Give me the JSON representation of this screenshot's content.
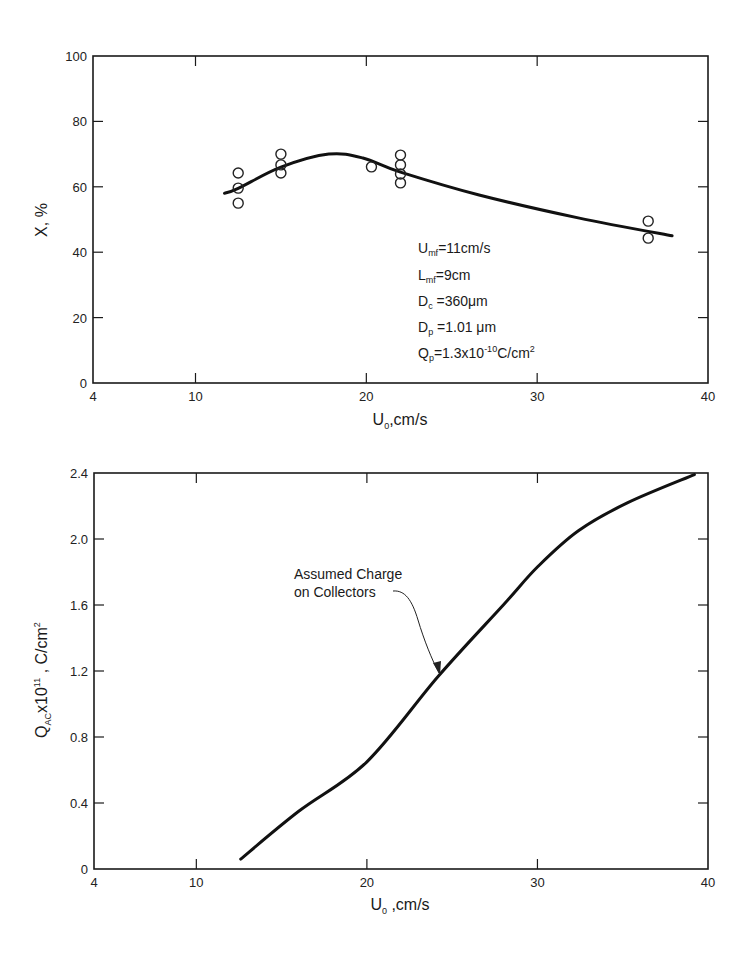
{
  "chart_data": [
    {
      "type": "line",
      "title": "",
      "xlabel": "U₀, cm/s",
      "ylabel": "X, %",
      "xlim": [
        4,
        40
      ],
      "ylim": [
        0,
        100
      ],
      "x_ticks": [
        "4",
        "10",
        "20",
        "30",
        "40"
      ],
      "y_ticks": [
        "0",
        "20",
        "40",
        "60",
        "80",
        "100"
      ],
      "grid": false,
      "series": [
        {
          "name": "fitted curve",
          "style": "line",
          "x": [
            11.7,
            12.5,
            15.0,
            17.8,
            19.8,
            22.0,
            26.6,
            32.4,
            37.9
          ],
          "y": [
            58.0,
            59.5,
            66.0,
            70.0,
            68.8,
            64.5,
            57.5,
            50.5,
            45.0
          ]
        },
        {
          "name": "experimental data",
          "style": "open-circle markers",
          "x": [
            12.5,
            12.5,
            12.5,
            15.0,
            15.0,
            15.0,
            20.3,
            22.0,
            22.0,
            22.0,
            22.0,
            36.5,
            36.5
          ],
          "y": [
            64.2,
            59.6,
            55.0,
            70.0,
            66.7,
            64.2,
            66.1,
            69.7,
            66.7,
            63.9,
            61.2,
            49.5,
            44.3
          ]
        }
      ],
      "annotations": [
        "U_mf = 11cm/s",
        "L_mf = 9cm",
        "D_c = 360 μm",
        "D_p = 1.01 μm",
        "Q_p = 1.3x10^-10 C/cm^2"
      ]
    },
    {
      "type": "line",
      "title": "",
      "xlabel": "U₀, cm/s",
      "ylabel": "Q_AC x 10^11, C/cm^2",
      "xlim": [
        4,
        40
      ],
      "ylim": [
        0,
        2.4
      ],
      "x_ticks": [
        "4",
        "10",
        "20",
        "30",
        "40"
      ],
      "y_ticks": [
        "0",
        "0.4",
        "0.8",
        "1.2",
        "1.6",
        "2.0",
        "2.4"
      ],
      "grid": false,
      "series": [
        {
          "name": "Assumed Charge on Collectors",
          "style": "line",
          "x": [
            12.6,
            16.0,
            20.0,
            24.2,
            28.0,
            30.0,
            32.4,
            35.3,
            39.2
          ],
          "y": [
            0.06,
            0.35,
            0.65,
            1.17,
            1.6,
            1.83,
            2.05,
            2.22,
            2.39
          ]
        }
      ],
      "annotations": [
        "Assumed Charge on Collectors"
      ]
    }
  ],
  "top_chart": {
    "y_ticks": [
      "100",
      "80",
      "60",
      "40",
      "20",
      "0"
    ],
    "x_ticks": [
      "4",
      "10",
      "20",
      "30",
      "40"
    ],
    "xlabel_main": "U",
    "xlabel_sub": "0",
    "xlabel_rest": ",cm/s",
    "ylabel": "X, %",
    "params": [
      {
        "main": "U",
        "sub": "mf",
        "rest": "=11cm/s"
      },
      {
        "main": "L",
        "sub": "mf",
        "rest": "=9cm"
      },
      {
        "main": "D",
        "sub": "c",
        "rest": " =360μm"
      },
      {
        "main": "D",
        "sub": "p",
        "rest": " =1.01 μm"
      },
      {
        "main": "Q",
        "sub": "p",
        "rest": "=1.3x10",
        "sup": "-10",
        "rest2": "C/cm",
        "sup2": "2"
      }
    ]
  },
  "bottom_chart": {
    "y_ticks": [
      "2.4",
      "2.0",
      "1.6",
      "1.2",
      "0.8",
      "0.4",
      "0"
    ],
    "x_ticks": [
      "4",
      "10",
      "20",
      "30",
      "40"
    ],
    "xlabel_main": "U",
    "xlabel_sub": "0",
    "xlabel_rest": " ,cm/s",
    "ylabel_main": "Q",
    "ylabel_sub": "AC",
    "ylabel_mid": "x10",
    "ylabel_sup": "11",
    "ylabel_rest": " , C/cm",
    "ylabel_sup2": "2",
    "annotation_line1": "Assumed Charge",
    "annotation_line2": "on Collectors"
  }
}
